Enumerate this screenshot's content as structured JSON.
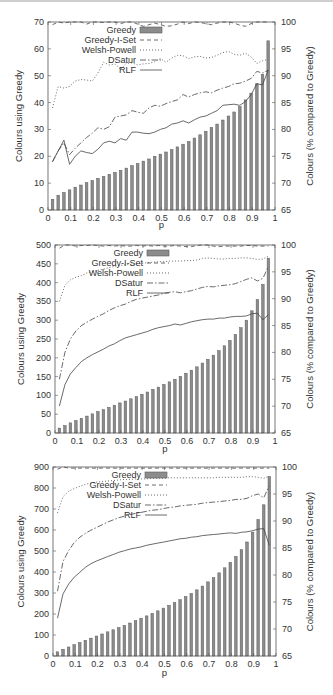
{
  "chart_data": [
    {
      "type": "bar+line",
      "title": "",
      "xlabel": "p",
      "ylabel": "Colours using Greedy",
      "y2label": "Colours (% compared to Greedy)",
      "xlim": [
        0,
        1
      ],
      "ylim": [
        0,
        70
      ],
      "y2lim": [
        65,
        100
      ],
      "xticks": [
        "0",
        "0.1",
        "0.2",
        "0.3",
        "0.4",
        "0.5",
        "0.6",
        "0.7",
        "0.8",
        "0.9",
        "1"
      ],
      "yticks": [
        "0",
        "10",
        "20",
        "30",
        "40",
        "50",
        "60",
        "70"
      ],
      "y2ticks": [
        "65",
        "70",
        "75",
        "80",
        "85",
        "90",
        "95",
        "100"
      ],
      "legend": [
        "Greedy",
        "Greedy-I-Set",
        "Welsh-Powell",
        "DSatur",
        "RLF"
      ],
      "legend_position": "top-left inside",
      "grid": false,
      "x": [
        0.02,
        0.045,
        0.07,
        0.095,
        0.12,
        0.145,
        0.17,
        0.195,
        0.22,
        0.245,
        0.27,
        0.295,
        0.32,
        0.345,
        0.37,
        0.395,
        0.42,
        0.445,
        0.47,
        0.495,
        0.52,
        0.545,
        0.57,
        0.595,
        0.62,
        0.645,
        0.67,
        0.695,
        0.72,
        0.745,
        0.77,
        0.795,
        0.82,
        0.845,
        0.87,
        0.895,
        0.92,
        0.945,
        0.97
      ],
      "series": [
        {
          "name": "Greedy",
          "axis": "left",
          "style": "bar",
          "values": [
            4,
            5.5,
            6.5,
            7.5,
            8.5,
            9.3,
            10.2,
            11,
            11.8,
            12.5,
            13.3,
            14,
            14.8,
            15.6,
            16.5,
            17.3,
            18.2,
            19,
            20,
            20.8,
            21.6,
            22.5,
            23.5,
            24.5,
            25.5,
            26.8,
            28,
            29.3,
            30.8,
            32,
            33.5,
            35,
            36.5,
            38.5,
            41,
            43.5,
            47,
            50.5,
            63
          ]
        },
        {
          "name": "Greedy-I-Set",
          "axis": "right",
          "style": "dashed",
          "values": [
            99.5,
            100.5,
            99.8,
            100.2,
            100.6,
            100.3,
            99.6,
            100.1,
            100.4,
            99.9,
            100.2,
            100.3,
            99.7,
            100.4,
            100,
            99.6,
            99.2,
            99.5,
            99.8,
            99.5,
            99.2,
            99.3,
            99.6,
            100,
            99.7,
            100.2,
            99.9,
            99.7,
            99.5,
            99.8,
            100.2,
            100.5,
            99.8,
            99.4,
            99.2,
            99.7,
            100,
            100.2,
            100
          ]
        },
        {
          "name": "Welsh-Powell",
          "axis": "right",
          "style": "dotted",
          "values": [
            84,
            88,
            87.7,
            88,
            89,
            89.3,
            89.2,
            89,
            90.5,
            92.5,
            92,
            92.2,
            91.2,
            92.3,
            92.4,
            92,
            92.2,
            92.3,
            92.6,
            93.2,
            92.5,
            93.3,
            93.8,
            93.7,
            93.2,
            93.5,
            93.6,
            93.3,
            93.4,
            93.8,
            94.3,
            94.5,
            94,
            93.8,
            94.2,
            93.5,
            92.3,
            92.8,
            93
          ]
        },
        {
          "name": "DSatur",
          "axis": "right",
          "style": "dashdot",
          "values": [
            74,
            76,
            77.5,
            75.3,
            76.5,
            77.5,
            78.5,
            79.3,
            80.3,
            80,
            80.5,
            82.3,
            82.5,
            82.7,
            83.5,
            83.2,
            83,
            84,
            84.5,
            84.3,
            84.8,
            85.2,
            85.5,
            86.5,
            86,
            86.5,
            86.8,
            87,
            86.8,
            87.3,
            87.7,
            88,
            88.5,
            88.6,
            89,
            89.5,
            90.8,
            90.5,
            91
          ]
        },
        {
          "name": "RLF",
          "axis": "right",
          "style": "solid",
          "values": [
            74,
            76,
            78,
            73.5,
            75,
            76,
            75.7,
            75.5,
            76.3,
            77.5,
            77.8,
            77.5,
            78.3,
            78,
            79.5,
            79.5,
            79.3,
            79.2,
            79.5,
            80,
            80.3,
            81,
            81.2,
            81.6,
            81.2,
            81.8,
            82.3,
            82.5,
            83,
            83.5,
            84.5,
            84.6,
            84.7,
            84.5,
            85.2,
            86.5,
            88.5,
            88.3,
            91
          ]
        }
      ]
    },
    {
      "type": "bar+line",
      "title": "",
      "xlabel": "p",
      "ylabel": "Colours using Greedy",
      "y2label": "Colours (% compared to Greedy)",
      "xlim": [
        0,
        1
      ],
      "ylim": [
        0,
        500
      ],
      "y2lim": [
        65,
        100
      ],
      "xticks": [
        "0",
        "0.1",
        "0.2",
        "0.3",
        "0.4",
        "0.5",
        "0.6",
        "0.7",
        "0.8",
        "0.9",
        "1"
      ],
      "yticks": [
        "0",
        "50",
        "100",
        "150",
        "200",
        "250",
        "300",
        "350",
        "400",
        "450",
        "500"
      ],
      "y2ticks": [
        "65",
        "70",
        "75",
        "80",
        "85",
        "90",
        "95",
        "100"
      ],
      "legend": [
        "Greedy",
        "Greedy-I-Set",
        "Welsh-Powell",
        "DSatur",
        "RLF"
      ],
      "legend_position": "top-left inside",
      "grid": false,
      "x": [
        0.02,
        0.045,
        0.07,
        0.095,
        0.12,
        0.145,
        0.17,
        0.195,
        0.22,
        0.245,
        0.27,
        0.295,
        0.32,
        0.345,
        0.37,
        0.395,
        0.42,
        0.445,
        0.47,
        0.495,
        0.52,
        0.545,
        0.57,
        0.595,
        0.62,
        0.645,
        0.67,
        0.695,
        0.72,
        0.745,
        0.77,
        0.795,
        0.82,
        0.845,
        0.87,
        0.895,
        0.92,
        0.945,
        0.97
      ],
      "series": [
        {
          "name": "Greedy",
          "axis": "left",
          "style": "bar",
          "values": [
            13,
            20,
            27,
            33,
            39,
            45,
            51,
            57,
            62,
            68,
            74,
            80,
            85,
            91,
            97,
            103,
            109,
            116,
            122,
            129,
            136,
            143,
            151,
            159,
            167,
            176,
            186,
            196,
            207,
            219,
            232,
            246,
            262,
            280,
            300,
            325,
            355,
            395,
            465
          ]
        },
        {
          "name": "Greedy-I-Set",
          "axis": "right",
          "style": "dashed",
          "values": [
            99.4,
            100.2,
            100.1,
            99.8,
            99.9,
            99.9,
            100,
            99.9,
            99.8,
            99.9,
            99.8,
            99.9,
            99.8,
            99.8,
            99.9,
            99.8,
            99.9,
            99.8,
            99.9,
            99.8,
            99.8,
            99.9,
            99.8,
            99.7,
            99.7,
            99.9,
            100.2,
            100.3,
            99.8,
            99.7,
            99.8,
            99.8,
            99.8,
            99.8,
            99.9,
            99.9,
            99.8,
            99.8,
            99.8
          ]
        },
        {
          "name": "Welsh-Powell",
          "axis": "right",
          "style": "dotted",
          "values": [
            89.5,
            92.5,
            93.5,
            94,
            94.3,
            94.8,
            95,
            95.3,
            95.5,
            95.8,
            96,
            96.2,
            96.3,
            96.4,
            96.5,
            96.6,
            96.7,
            96.8,
            96.9,
            96.9,
            97,
            97,
            97,
            97.1,
            97.1,
            97.2,
            97.5,
            97.6,
            97.5,
            97.4,
            97.4,
            97.5,
            97.5,
            97.6,
            97.6,
            97.5,
            97.3,
            97.4,
            97.9
          ]
        },
        {
          "name": "DSatur",
          "axis": "right",
          "style": "dashdot",
          "values": [
            75,
            80,
            82.5,
            84,
            85,
            85.6,
            86.2,
            86.7,
            87.2,
            87.8,
            88.3,
            88.7,
            89,
            89.5,
            89.9,
            90.1,
            90.3,
            90.5,
            90.7,
            91,
            91.2,
            91.3,
            91.1,
            91.3,
            91.5,
            91.8,
            92.1,
            92.3,
            92.2,
            92.4,
            92.5,
            92.6,
            92.8,
            93.2,
            93.6,
            93.9,
            93.3,
            93.8,
            96
          ]
        },
        {
          "name": "RLF",
          "axis": "right",
          "style": "solid",
          "values": [
            70,
            74,
            76,
            77.2,
            78.3,
            79,
            79.6,
            80.1,
            80.6,
            81.2,
            81.6,
            82.2,
            82.7,
            83,
            83.3,
            83.6,
            83.9,
            84.3,
            84.6,
            84.8,
            85,
            85.3,
            85.1,
            85.4,
            85.7,
            85.9,
            86.1,
            86.2,
            86.2,
            86.4,
            86.4,
            86.6,
            86.7,
            86.7,
            86.8,
            87.2,
            87.3,
            86.1,
            87
          ]
        }
      ]
    },
    {
      "type": "bar+line",
      "title": "",
      "xlabel": "p",
      "ylabel": "Colours using Greedy",
      "y2label": "Colours (% compared to Greedy)",
      "xlim": [
        0,
        1
      ],
      "ylim": [
        0,
        900
      ],
      "y2lim": [
        65,
        100
      ],
      "xticks": [
        "0",
        "0.1",
        "0.2",
        "0.3",
        "0.4",
        "0.5",
        "0.6",
        "0.7",
        "0.8",
        "0.9",
        "1"
      ],
      "yticks": [
        "0",
        "100",
        "200",
        "300",
        "400",
        "500",
        "600",
        "700",
        "800",
        "900"
      ],
      "y2ticks": [
        "65",
        "70",
        "75",
        "80",
        "85",
        "90",
        "95",
        "100"
      ],
      "legend": [
        "Greedy",
        "Greedy-I-Set",
        "Welsh-Powell",
        "DSatur",
        "RLF"
      ],
      "legend_position": "top-left inside",
      "grid": false,
      "x": [
        0.02,
        0.045,
        0.07,
        0.095,
        0.12,
        0.145,
        0.17,
        0.195,
        0.22,
        0.245,
        0.27,
        0.295,
        0.32,
        0.345,
        0.37,
        0.395,
        0.42,
        0.445,
        0.47,
        0.495,
        0.52,
        0.545,
        0.57,
        0.595,
        0.62,
        0.645,
        0.67,
        0.695,
        0.72,
        0.745,
        0.77,
        0.795,
        0.82,
        0.845,
        0.87,
        0.895,
        0.92,
        0.945,
        0.97
      ],
      "series": [
        {
          "name": "Greedy",
          "axis": "left",
          "style": "bar",
          "values": [
            20,
            32,
            43,
            54,
            64,
            75,
            85,
            95,
            105,
            115,
            125,
            135,
            146,
            157,
            168,
            180,
            191,
            203,
            215,
            228,
            241,
            254,
            268,
            283,
            298,
            315,
            333,
            353,
            373,
            396,
            420,
            446,
            474,
            506,
            543,
            590,
            650,
            720,
            855
          ]
        },
        {
          "name": "Greedy-I-Set",
          "axis": "right",
          "style": "dashed",
          "values": [
            99.6,
            100.2,
            99.8,
            99.8,
            99.8,
            99.8,
            99.8,
            99.8,
            99.8,
            99.8,
            99.8,
            99.8,
            99.8,
            99.8,
            99.8,
            99.8,
            99.8,
            99.8,
            99.8,
            99.8,
            99.8,
            99.8,
            99.8,
            99.8,
            99.8,
            99.8,
            99.8,
            99.8,
            99.8,
            99.8,
            99.8,
            99.8,
            99.8,
            99.8,
            99.8,
            99.8,
            99.8,
            99.8,
            99.8
          ]
        },
        {
          "name": "Welsh-Powell",
          "axis": "right",
          "style": "dotted",
          "values": [
            91.5,
            94.5,
            95.5,
            96,
            96.4,
            96.8,
            97,
            97.2,
            97.3,
            97.4,
            97.5,
            97.6,
            97.7,
            97.7,
            97.8,
            97.8,
            97.8,
            97.9,
            97.9,
            97.9,
            98,
            98,
            98,
            98,
            98,
            98,
            98,
            98,
            98,
            98.1,
            98.1,
            98.1,
            98.1,
            98.1,
            98.2,
            98.2,
            98.1,
            97.9,
            98.3
          ]
        },
        {
          "name": "DSatur",
          "axis": "right",
          "style": "dashdot",
          "values": [
            77,
            82.5,
            84.5,
            86,
            87,
            87.7,
            88.3,
            88.8,
            89.3,
            89.8,
            90.2,
            90.6,
            90.9,
            91.2,
            91.4,
            91.6,
            91.8,
            92,
            92.1,
            92.3,
            92.5,
            92.6,
            92.8,
            92.9,
            93,
            93.1,
            93.3,
            93.4,
            93.5,
            93.6,
            93.7,
            93.8,
            94,
            94,
            94.2,
            94.7,
            95,
            94.3,
            96.5
          ]
        },
        {
          "name": "RLF",
          "axis": "right",
          "style": "solid",
          "values": [
            72,
            76.5,
            78.3,
            79.6,
            80.5,
            81.4,
            82.1,
            82.6,
            83,
            83.4,
            83.8,
            84.2,
            84.5,
            84.8,
            85,
            85.2,
            85.5,
            85.7,
            85.9,
            86.1,
            86.3,
            86.5,
            86.7,
            86.8,
            87,
            87.1,
            87.3,
            87.4,
            87.5,
            87.6,
            87.7,
            87.8,
            87.7,
            87.9,
            88,
            88.2,
            88.5,
            88.6,
            85.5
          ]
        }
      ]
    }
  ],
  "charts": [
    {
      "ylabel": "Colours using Greedy",
      "y2label": "Colours (% compared to Greedy)",
      "xlabel": "p"
    },
    {
      "ylabel": "Colours using Greedy",
      "y2label": "Colours (% compared to Greedy)",
      "xlabel": "p"
    },
    {
      "ylabel": "Colours using Greedy",
      "y2label": "Colours (% compared to Greedy)",
      "xlabel": "p"
    }
  ],
  "colors": {
    "bar_fill": "#8c8c8c",
    "bar_stroke": "#5a5a5a",
    "line": "#444444",
    "axis": "#555555",
    "text": "#333333"
  }
}
